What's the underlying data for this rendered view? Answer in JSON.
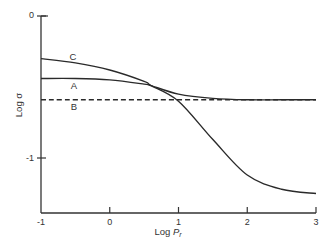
{
  "chart_data": {
    "type": "line",
    "title": "",
    "xlabel": "Log P",
    "xlabel_subscript": "r",
    "ylabel": "Log σ",
    "xlim": [
      -1,
      3
    ],
    "ylim": [
      -1.3,
      0
    ],
    "xticks": [
      -1,
      0,
      1,
      2,
      3
    ],
    "xtick_labels": [
      "-1",
      "0",
      "1",
      "2",
      "3"
    ],
    "yticks": [
      0,
      -1
    ],
    "ytick_labels": [
      "0",
      "-1"
    ],
    "grid": false,
    "legend": "inline curve labels",
    "series": [
      {
        "name": "C",
        "style": "solid",
        "x": [
          -1,
          -0.5,
          0,
          0.5,
          0.6,
          1,
          1.5,
          2,
          2.5,
          3
        ],
        "y": [
          -0.3,
          -0.33,
          -0.38,
          -0.46,
          -0.49,
          -0.6,
          -0.87,
          -1.12,
          -1.22,
          -1.25
        ]
      },
      {
        "name": "A",
        "style": "solid",
        "x": [
          -1,
          -0.5,
          0,
          0.5,
          0.6,
          1,
          1.5,
          2,
          2.5,
          3
        ],
        "y": [
          -0.44,
          -0.44,
          -0.45,
          -0.48,
          -0.49,
          -0.55,
          -0.58,
          -0.59,
          -0.59,
          -0.59
        ]
      },
      {
        "name": "B",
        "style": "dashed",
        "x": [
          -1,
          3
        ],
        "y": [
          -0.59,
          -0.59
        ]
      }
    ]
  }
}
